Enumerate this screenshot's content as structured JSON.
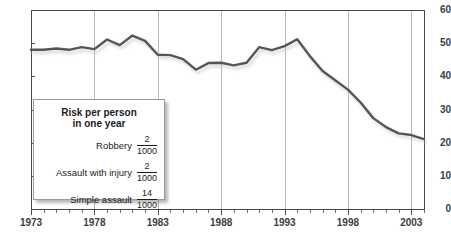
{
  "chart_data": {
    "type": "line",
    "title": "",
    "xlabel": "",
    "ylabel": "",
    "xlim": [
      1973,
      2004
    ],
    "ylim": [
      0,
      60
    ],
    "ytick_labels": [
      "0",
      "10",
      "20",
      "30",
      "40",
      "50",
      "60"
    ],
    "ytick_values": [
      0,
      10,
      20,
      30,
      40,
      50,
      60
    ],
    "xtick_labels": [
      "1973",
      "1978",
      "1983",
      "1988",
      "1993",
      "1998",
      "2003"
    ],
    "xtick_values": [
      1973,
      1978,
      1983,
      1988,
      1993,
      1998,
      2003
    ],
    "grid": "vertical-only",
    "legend_position": "inset-lower-left",
    "series": [
      {
        "name": "Violent crime victimization rate",
        "color": "#555555",
        "x": [
          1973,
          1974,
          1975,
          1976,
          1977,
          1978,
          1979,
          1980,
          1981,
          1982,
          1983,
          1984,
          1985,
          1986,
          1987,
          1988,
          1989,
          1990,
          1991,
          1992,
          1993,
          1994,
          1995,
          1996,
          1997,
          1998,
          1999,
          2000,
          2001,
          2002,
          2003,
          2004
        ],
        "values": [
          48.0,
          48.0,
          48.4,
          48.0,
          48.8,
          48.2,
          51.1,
          49.4,
          52.3,
          50.7,
          46.5,
          46.4,
          45.2,
          42.0,
          44.0,
          44.1,
          43.3,
          44.1,
          48.8,
          47.9,
          49.1,
          51.2,
          46.1,
          41.6,
          38.8,
          36.0,
          32.1,
          27.4,
          24.7,
          22.8,
          22.3,
          21.1
        ]
      }
    ],
    "annotations": {
      "legend_box": {
        "title_line1": "Risk per person",
        "title_line2": "in one year",
        "rows": [
          {
            "label": "Robbery",
            "numerator": "2",
            "denominator": "1000"
          },
          {
            "label": "Assault with injury",
            "numerator": "2",
            "denominator": "1000"
          },
          {
            "label": "Simple assault",
            "numerator": "14",
            "denominator": "1000"
          }
        ]
      }
    }
  },
  "caption": {
    "text": ""
  }
}
